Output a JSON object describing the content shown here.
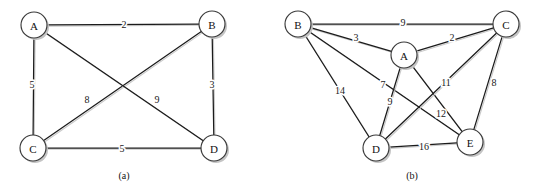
{
  "figure": {
    "background_color": "#ffffff",
    "edge_color": "#1b1b1b",
    "node_fill": "#ffffff",
    "node_stroke": "#3a3a3a",
    "label_color": "#111111"
  },
  "graphs": [
    {
      "id": "graph-a",
      "caption": "(a)",
      "caption_pos": {
        "x": 124,
        "y": 175
      },
      "type": "weighted-undirected-graph",
      "node_radius": 13,
      "nodes": [
        {
          "id": "A",
          "label": "A",
          "x": 34,
          "y": 25
        },
        {
          "id": "B",
          "label": "B",
          "x": 212,
          "y": 24
        },
        {
          "id": "C",
          "label": "C",
          "x": 33,
          "y": 148
        },
        {
          "id": "D",
          "label": "D",
          "x": 214,
          "y": 148
        }
      ],
      "edges": [
        {
          "from": "A",
          "to": "B",
          "weight": "2",
          "label_x": 124,
          "label_y": 24
        },
        {
          "from": "A",
          "to": "C",
          "weight": "5",
          "label_x": 32,
          "label_y": 84
        },
        {
          "from": "B",
          "to": "D",
          "weight": "3",
          "label_x": 212,
          "label_y": 84
        },
        {
          "from": "C",
          "to": "D",
          "weight": "5",
          "label_x": 122,
          "label_y": 148
        },
        {
          "from": "C",
          "to": "B",
          "weight": "8",
          "label_x": 87,
          "label_y": 99
        },
        {
          "from": "A",
          "to": "D",
          "weight": "9",
          "label_x": 157,
          "label_y": 99
        }
      ]
    },
    {
      "id": "graph-b",
      "caption": "(b)",
      "caption_pos": {
        "x": 412,
        "y": 175
      },
      "type": "weighted-undirected-graph",
      "node_radius": 13,
      "nodes": [
        {
          "id": "B",
          "label": "B",
          "x": 298,
          "y": 24
        },
        {
          "id": "C",
          "label": "C",
          "x": 506,
          "y": 24
        },
        {
          "id": "A",
          "label": "A",
          "x": 404,
          "y": 55
        },
        {
          "id": "D",
          "label": "D",
          "x": 376,
          "y": 148
        },
        {
          "id": "E",
          "label": "E",
          "x": 470,
          "y": 142
        }
      ],
      "edges": [
        {
          "from": "B",
          "to": "C",
          "weight": "9",
          "label_x": 403,
          "label_y": 22
        },
        {
          "from": "B",
          "to": "A",
          "weight": "3",
          "label_x": 356,
          "label_y": 37
        },
        {
          "from": "A",
          "to": "C",
          "weight": "2",
          "label_x": 452,
          "label_y": 37
        },
        {
          "from": "B",
          "to": "D",
          "weight": "14",
          "label_x": 340,
          "label_y": 90
        },
        {
          "from": "B",
          "to": "E",
          "weight": "7",
          "label_x": 383,
          "label_y": 84
        },
        {
          "from": "A",
          "to": "D",
          "weight": "9",
          "label_x": 390,
          "label_y": 101
        },
        {
          "from": "A",
          "to": "E",
          "weight": "11",
          "label_x": 446,
          "label_y": 82
        },
        {
          "from": "C",
          "to": "D",
          "weight": "12",
          "label_x": 441,
          "label_y": 113
        },
        {
          "from": "C",
          "to": "E",
          "weight": "8",
          "label_x": 494,
          "label_y": 82
        },
        {
          "from": "D",
          "to": "E",
          "weight": "16",
          "label_x": 424,
          "label_y": 146
        }
      ]
    }
  ]
}
